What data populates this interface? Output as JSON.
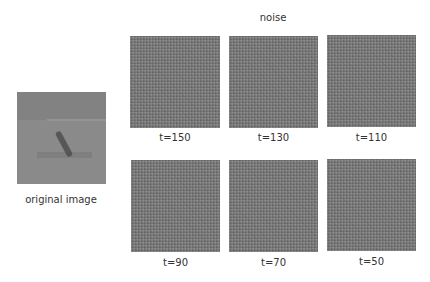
{
  "title": "noise",
  "original": {
    "label": "original image"
  },
  "panels": [
    {
      "label": "t=150",
      "step": 150
    },
    {
      "label": "t=130",
      "step": 130
    },
    {
      "label": "t=110",
      "step": 110
    },
    {
      "label": "t=90",
      "step": 90
    },
    {
      "label": "t=70",
      "step": 70
    },
    {
      "label": "t=50",
      "step": 50
    }
  ],
  "colors": {
    "noise_gray": "#7a7a7a",
    "background": "#ffffff",
    "text": "#333333"
  }
}
